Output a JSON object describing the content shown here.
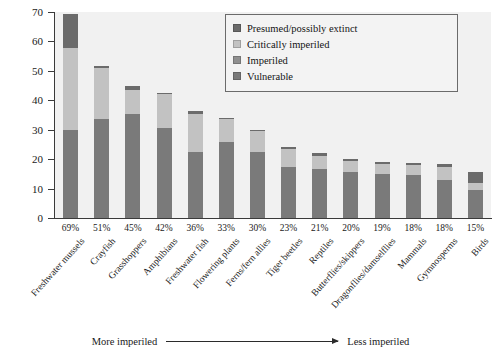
{
  "chart_data": {
    "type": "bar",
    "subtype": "stacked-bar",
    "title": "",
    "xlabel": "",
    "ylabel": "Percent of species",
    "ylim": [
      0,
      70
    ],
    "yticks": [
      0,
      10,
      20,
      30,
      40,
      50,
      60,
      70
    ],
    "grid": false,
    "legend_position": "top-right",
    "categories": [
      "Freshwater mussels",
      "Crayfish",
      "Grasshoppers",
      "Amphibians",
      "Freshwater fish",
      "Flowering plants",
      "Ferns/fern allies",
      "Tiger beetles",
      "Reptiles",
      "Butterflies/skippers",
      "Dragonflies/damselflies",
      "Mammals",
      "Gymnosperms",
      "Birds"
    ],
    "totals_labels": [
      "69%",
      "51%",
      "45%",
      "42%",
      "36%",
      "33%",
      "30%",
      "23%",
      "21%",
      "20%",
      "19%",
      "18%",
      "18%",
      "15%"
    ],
    "totals": [
      69,
      51,
      45,
      42,
      36,
      33,
      30,
      23,
      21,
      20,
      19,
      18,
      18,
      15
    ],
    "series": [
      {
        "name": "Vulnerable",
        "color": "#7a7a7a",
        "values": [
          30.0,
          33.5,
          35.5,
          30.5,
          22.5,
          26.0,
          22.5,
          17.5,
          16.5,
          15.5,
          15.0,
          14.5,
          13.0,
          9.5
        ]
      },
      {
        "name": "Imperiled",
        "color": "#8f8f8f",
        "values": [
          0,
          0,
          0,
          0,
          0,
          0,
          0,
          0,
          0,
          0,
          0,
          0,
          0,
          0
        ]
      },
      {
        "name": "Critically imperiled",
        "color": "#c2c2c2",
        "values": [
          27.8,
          17.5,
          8.0,
          11.5,
          13.0,
          7.5,
          7.0,
          6.0,
          4.5,
          4.0,
          3.2,
          3.5,
          4.5,
          2.5
        ]
      },
      {
        "name": "Presumed/possibly extinct",
        "color": "#6b6b6b",
        "values": [
          11.7,
          0.5,
          1.5,
          0.5,
          1.0,
          0.5,
          0.5,
          0.5,
          1.0,
          0.7,
          1.0,
          0.8,
          0.8,
          3.5
        ]
      }
    ],
    "annotation_left": "More imperiled",
    "annotation_right": "Less imperiled",
    "plot_background": "#f1f1f1"
  },
  "legend": {
    "items": [
      {
        "label": "Presumed/possibly extinct",
        "color": "#6b6b6b"
      },
      {
        "label": "Critically imperiled",
        "color": "#c2c2c2"
      },
      {
        "label": "Imperiled",
        "color": "#8f8f8f"
      },
      {
        "label": "Vulnerable",
        "color": "#7a7a7a"
      }
    ]
  }
}
